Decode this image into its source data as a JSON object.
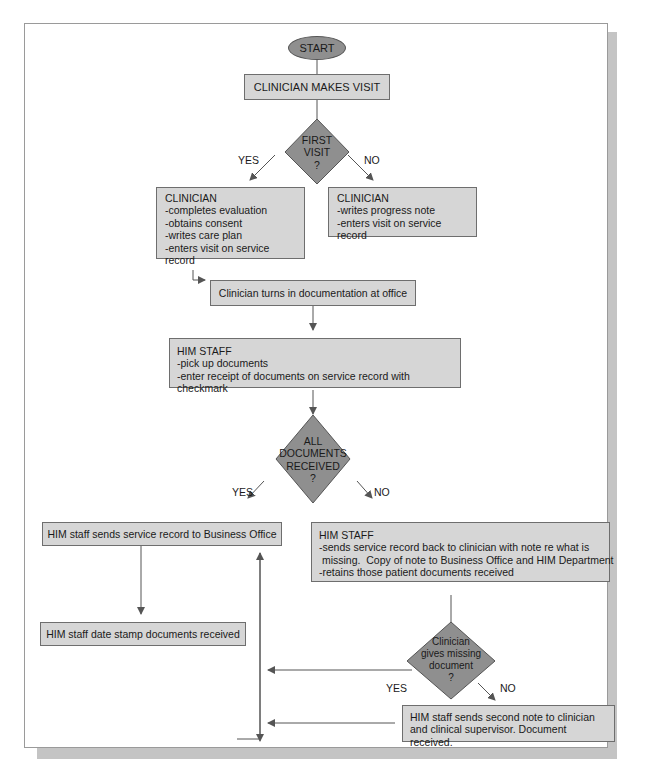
{
  "figure": {
    "start": "START",
    "step_visit": "CLINICIAN MAKES VISIT",
    "decision_first_visit": {
      "lines": [
        "FIRST",
        "VISIT",
        "?"
      ]
    },
    "branch_yes_1": "YES",
    "branch_no_1": "NO",
    "clinician_yes": {
      "title": "CLINICIAN",
      "items": [
        "-completes evaluation",
        "-obtains consent",
        "-writes care plan",
        "-enters visit on service record"
      ]
    },
    "clinician_no": {
      "title": "CLINICIAN",
      "items": [
        "-writes progress note",
        "-enters visit on service record"
      ]
    },
    "step_turn_in": "Clinician turns in documentation at office",
    "him_staff_pickup": {
      "title": "HIM STAFF",
      "items": [
        "-pick up documents",
        "-enter receipt of documents on service record with checkmark"
      ]
    },
    "decision_all_docs": {
      "lines": [
        "ALL",
        "DOCUMENTS",
        "RECEIVED",
        "?"
      ]
    },
    "branch_yes_2": "YES",
    "branch_no_2": "NO",
    "step_send_business": "HIM staff sends service record to Business Office",
    "him_staff_missing": {
      "title": "HIM STAFF",
      "items": [
        "-sends service record back to clinician with note re what is",
        " missing.  Copy of note to Business Office and HIM Department",
        "-retains those patient documents received"
      ]
    },
    "step_date_stamp": "HIM staff date stamp documents received",
    "decision_missing": {
      "lines": [
        "Clinician",
        "gives missing",
        "document",
        "?"
      ]
    },
    "branch_yes_3": "YES",
    "branch_no_3": "NO",
    "step_second_note": {
      "lines": [
        "HIM staff sends second note to clinician",
        "and clinical supervisor. Document received."
      ]
    }
  },
  "colors": {
    "box_fill": "#d6d6d6",
    "diamond_fill": "#8f8f8f",
    "shadow": "#c4c4c4",
    "line": "#555555"
  }
}
